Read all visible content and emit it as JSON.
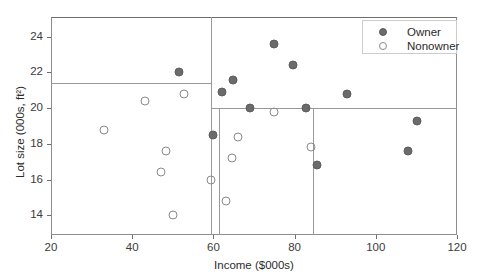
{
  "chart_data": {
    "type": "scatter",
    "title": "",
    "xlabel": "Income ($000s)",
    "ylabel": "Lot size (000s, ft²)",
    "xlim": [
      20,
      120
    ],
    "ylim": [
      12.9,
      25.1
    ],
    "xticks": [
      20,
      40,
      60,
      80,
      100,
      120
    ],
    "yticks": [
      14,
      16,
      18,
      20,
      22,
      24
    ],
    "grid": false,
    "legend_position": "upper right",
    "legend": [
      {
        "label": "Owner",
        "marker": "filled-circle",
        "color": "#6b6b6b"
      },
      {
        "label": "Nonowner",
        "marker": "open-circle",
        "color": "#8a8a8a"
      }
    ],
    "series": [
      {
        "name": "Owner",
        "marker": "filled-circle",
        "color": "#6b6b6b",
        "points": [
          {
            "x": 51.5,
            "y": 22.0
          },
          {
            "x": 60.0,
            "y": 18.5
          },
          {
            "x": 62.0,
            "y": 20.9
          },
          {
            "x": 64.8,
            "y": 21.6
          },
          {
            "x": 69.0,
            "y": 20.0
          },
          {
            "x": 75.0,
            "y": 23.6
          },
          {
            "x": 79.5,
            "y": 22.4
          },
          {
            "x": 82.8,
            "y": 20.0
          },
          {
            "x": 85.5,
            "y": 16.8
          },
          {
            "x": 93.0,
            "y": 20.8
          },
          {
            "x": 108.0,
            "y": 17.6
          },
          {
            "x": 110.1,
            "y": 19.3
          }
        ]
      },
      {
        "name": "Nonowner",
        "marker": "open-circle",
        "color": "#8a8a8a",
        "points": [
          {
            "x": 33.0,
            "y": 18.8
          },
          {
            "x": 43.2,
            "y": 20.4
          },
          {
            "x": 47.0,
            "y": 16.4
          },
          {
            "x": 48.4,
            "y": 17.6
          },
          {
            "x": 50.1,
            "y": 14.0
          },
          {
            "x": 52.8,
            "y": 20.8
          },
          {
            "x": 59.4,
            "y": 16.0
          },
          {
            "x": 63.0,
            "y": 14.8
          },
          {
            "x": 64.5,
            "y": 17.2
          },
          {
            "x": 66.0,
            "y": 18.4
          },
          {
            "x": 75.0,
            "y": 19.8
          },
          {
            "x": 84.0,
            "y": 17.8
          }
        ]
      }
    ],
    "split_lines": [
      {
        "orientation": "horizontal",
        "value": 21.4,
        "from": 20.0,
        "to": 59.5
      },
      {
        "orientation": "vertical",
        "value": 59.5,
        "from": 12.9,
        "to": 25.1
      },
      {
        "orientation": "vertical",
        "value": 61.5,
        "from": 12.9,
        "to": 20.0
      },
      {
        "orientation": "horizontal",
        "value": 20.0,
        "from": 59.5,
        "to": 120.0
      },
      {
        "orientation": "vertical",
        "value": 84.6,
        "from": 12.9,
        "to": 20.0
      }
    ]
  }
}
